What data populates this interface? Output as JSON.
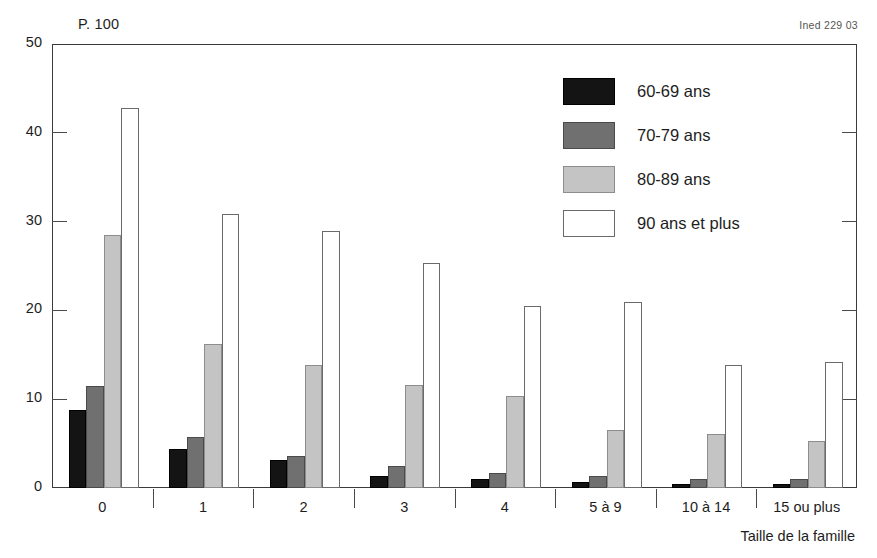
{
  "annotations": {
    "unit_note": "P. 100",
    "source_note": "Ined 229 03"
  },
  "chart_data": {
    "type": "bar",
    "title": "",
    "subtitle": "",
    "xlabel": "Taille de la famille",
    "ylabel": "P. 100",
    "grid": false,
    "legend_position": "top-right",
    "ylim": [
      0,
      50
    ],
    "yticks": [
      0,
      10,
      20,
      30,
      40,
      50
    ],
    "ytick_labels": [
      "0",
      "10",
      "20",
      "30",
      "40",
      "50"
    ],
    "categories": [
      "0",
      "1",
      "2",
      "3",
      "4",
      "5 à 9",
      "10 à 14",
      "15 ou plus"
    ],
    "series": [
      {
        "name": "60-69 ans",
        "color": "#141414",
        "values": [
          8.8,
          4.4,
          3.2,
          1.3,
          1.0,
          0.7,
          0.5,
          0.5
        ]
      },
      {
        "name": "70-79 ans",
        "color": "#707070",
        "values": [
          11.5,
          5.7,
          3.6,
          2.5,
          1.7,
          1.4,
          1.0,
          1.0
        ]
      },
      {
        "name": "80-89 ans",
        "color": "#c4c4c4",
        "values": [
          28.5,
          16.2,
          13.8,
          11.6,
          10.4,
          6.5,
          6.1,
          5.3
        ]
      },
      {
        "name": "90 ans et plus",
        "color": "#ffffff",
        "values": [
          42.8,
          30.8,
          28.9,
          25.3,
          20.5,
          20.9,
          13.9,
          14.2
        ]
      }
    ]
  }
}
